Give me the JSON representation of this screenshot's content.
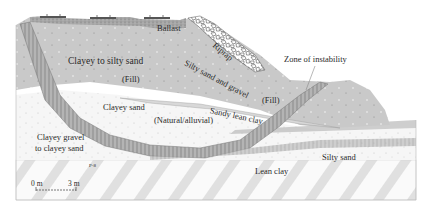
{
  "diagram": {
    "type": "geotechnical-cross-section",
    "labels": {
      "ballast": "Ballast",
      "riprap": "Riprap",
      "clayey_to_silty_sand": "Clayey to silty sand",
      "fill_upper": "(Fill)",
      "silty_sand_and_gravel": "Silty sand and gravel",
      "zone_of_instability": "Zone of instability",
      "fill_right": "(Fill)",
      "clayey_sand": "Clayey sand",
      "sandy_lean_clay": "Sandy lean clay",
      "natural_alluvial": "(Natural/alluvial)",
      "clayey_gravel_line1": "Clayey gravel",
      "clayey_gravel_line2": "to clayey sand",
      "silty_sand": "Silty sand",
      "lean_clay": "Lean clay",
      "boring_marker": "P-8"
    },
    "scale_bar": {
      "start_label": "0 m",
      "end_label": "3 m"
    },
    "colors": {
      "fill_gray": "#c9c9c9",
      "ballast_gray": "#9a9a9a",
      "track_dark": "#555555",
      "slip_band": "#a8a8a8",
      "natural_light": "#f3f3f3",
      "lean_clay_stripe": "#dcdcdc",
      "outline": "#6a6a6a"
    }
  }
}
